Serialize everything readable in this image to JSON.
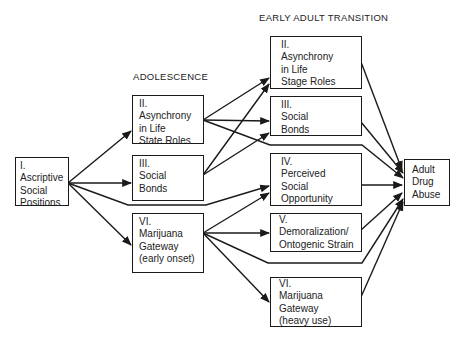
{
  "diagram": {
    "stage_labels": {
      "adolescence": "ADOLESCENCE",
      "early_adult": "EARLY ADULT TRANSITION"
    },
    "nodes": {
      "ascriptive": {
        "lines": [
          "I.",
          "Ascriptive",
          "Social",
          "Positions"
        ]
      },
      "adol_asynchrony": {
        "lines": [
          "II.",
          "Asynchrony",
          "in Life",
          "State Roles"
        ]
      },
      "adol_social_bonds": {
        "lines": [
          "III.",
          "Social",
          "Bonds"
        ]
      },
      "adol_marijuana": {
        "lines": [
          "VI.",
          "Marijuana",
          "Gateway",
          "(early onset)"
        ]
      },
      "ea_asynchrony": {
        "lines": [
          "II.",
          "Asynchrony",
          "in Life",
          "Stage Roles"
        ]
      },
      "ea_social_bonds": {
        "lines": [
          "III.",
          "Social",
          "Bonds"
        ]
      },
      "ea_perceived_opportunity": {
        "lines": [
          "IV.",
          "Perceived",
          "Social",
          "Opportunity"
        ]
      },
      "ea_demoralization": {
        "lines": [
          "V.",
          "Demoralization/",
          "Ontogenic Strain"
        ]
      },
      "ea_marijuana": {
        "lines": [
          "VI.",
          "Marijuana",
          "Gateway",
          "(heavy use)"
        ]
      },
      "adult_drug_abuse": {
        "lines": [
          "Adult",
          "Drug",
          "Abuse"
        ]
      }
    },
    "edges": [
      {
        "from": "ascriptive",
        "to": "adol_asynchrony"
      },
      {
        "from": "ascriptive",
        "to": "adol_social_bonds"
      },
      {
        "from": "ascriptive",
        "to": "adol_marijuana"
      },
      {
        "from": "ascriptive",
        "to": "ea_perceived_opportunity"
      },
      {
        "from": "adol_asynchrony",
        "to": "ea_asynchrony"
      },
      {
        "from": "adol_asynchrony",
        "to": "ea_social_bonds"
      },
      {
        "from": "adol_asynchrony",
        "to": "adult_drug_abuse"
      },
      {
        "from": "adol_social_bonds",
        "to": "ea_asynchrony"
      },
      {
        "from": "adol_social_bonds",
        "to": "ea_social_bonds"
      },
      {
        "from": "adol_marijuana",
        "to": "ea_perceived_opportunity"
      },
      {
        "from": "adol_marijuana",
        "to": "ea_demoralization"
      },
      {
        "from": "adol_marijuana",
        "to": "ea_marijuana"
      },
      {
        "from": "adol_marijuana",
        "to": "adult_drug_abuse"
      },
      {
        "from": "ea_asynchrony",
        "to": "adult_drug_abuse"
      },
      {
        "from": "ea_social_bonds",
        "to": "adult_drug_abuse"
      },
      {
        "from": "ea_perceived_opportunity",
        "to": "adult_drug_abuse"
      },
      {
        "from": "ea_demoralization",
        "to": "adult_drug_abuse"
      },
      {
        "from": "ea_marijuana",
        "to": "adult_drug_abuse"
      }
    ],
    "colors": {
      "line": "#1a1a1a",
      "background": "#ffffff"
    }
  }
}
